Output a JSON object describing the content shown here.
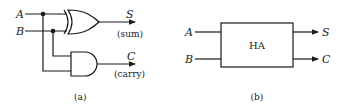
{
  "panel_a": {
    "inputs": {
      "a": "A",
      "b": "B"
    },
    "outputs": {
      "s": "S",
      "s_desc": "(sum)",
      "c": "C",
      "c_desc": "(carry)"
    },
    "gates": [
      "XOR",
      "AND"
    ],
    "caption": "(a)"
  },
  "panel_b": {
    "block_label": "HA",
    "inputs": {
      "a": "A",
      "b": "B"
    },
    "outputs": {
      "s": "S",
      "c": "C"
    },
    "caption": "(b)"
  },
  "colors": {
    "ink": "#1a1a1a",
    "background": "#ffffff"
  }
}
